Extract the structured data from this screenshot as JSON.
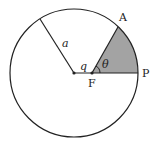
{
  "diagram": {
    "type": "circle-sector",
    "colors": {
      "stroke": "#222222",
      "shade": "#a3a3a3",
      "background": "#ffffff"
    },
    "labels": {
      "radius": "a",
      "offset": "q",
      "angle": "θ",
      "point_A": "A",
      "point_F": "F",
      "point_P": "P"
    }
  }
}
